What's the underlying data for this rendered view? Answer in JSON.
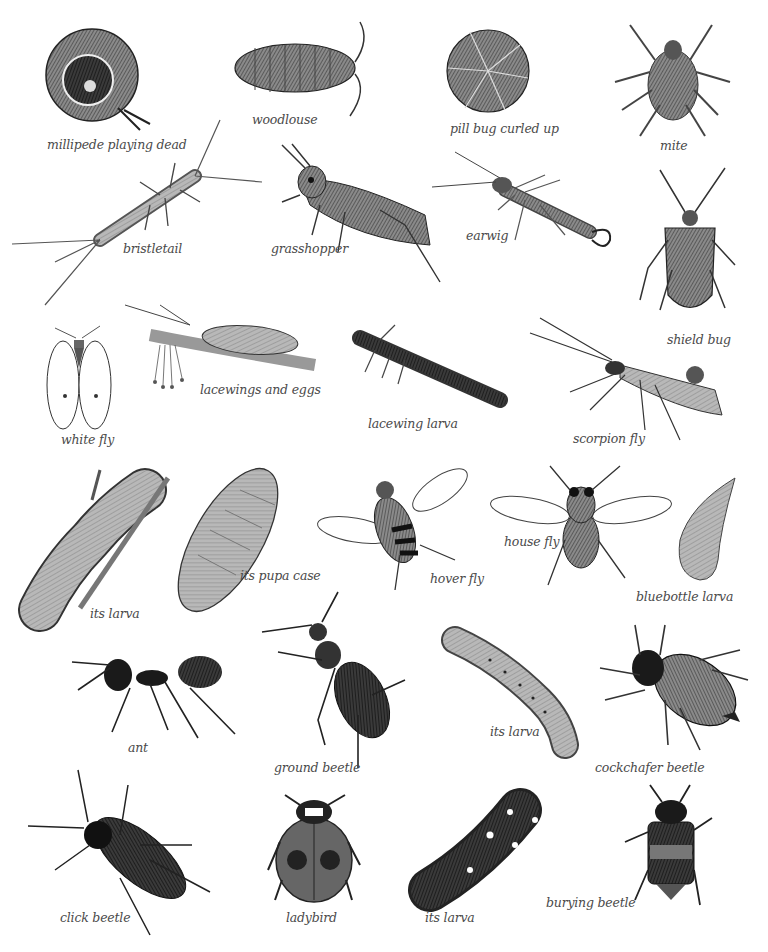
{
  "plate": {
    "background": "#ffffff",
    "ink_color": "#4a4a4a",
    "specimens": [
      {
        "id": "millipede",
        "label": "millipede playing dead",
        "x": 47,
        "y": 137
      },
      {
        "id": "woodlouse",
        "label": "woodlouse",
        "x": 252,
        "y": 112
      },
      {
        "id": "pill-bug",
        "label": "pill bug curled up",
        "x": 450,
        "y": 121
      },
      {
        "id": "mite",
        "label": "mite",
        "x": 660,
        "y": 138
      },
      {
        "id": "bristletail",
        "label": "bristletail",
        "x": 123,
        "y": 241
      },
      {
        "id": "grasshopper",
        "label": "grasshopper",
        "x": 271,
        "y": 241
      },
      {
        "id": "earwig",
        "label": "earwig",
        "x": 466,
        "y": 228
      },
      {
        "id": "shield-bug",
        "label": "shield bug",
        "x": 667,
        "y": 332
      },
      {
        "id": "lacewings",
        "label": "lacewings and eggs",
        "x": 200,
        "y": 382
      },
      {
        "id": "white-fly",
        "label": "white fly",
        "x": 61,
        "y": 432
      },
      {
        "id": "lacewing-larva",
        "label": "lacewing larva",
        "x": 368,
        "y": 416
      },
      {
        "id": "scorpion-fly",
        "label": "scorpion fly",
        "x": 573,
        "y": 431
      },
      {
        "id": "hover-fly-larva",
        "label": "its larva",
        "x": 90,
        "y": 606
      },
      {
        "id": "hover-fly-pupa",
        "label": "its pupa case",
        "x": 240,
        "y": 568
      },
      {
        "id": "hover-fly",
        "label": "hover fly",
        "x": 430,
        "y": 571
      },
      {
        "id": "house-fly",
        "label": "house fly",
        "x": 504,
        "y": 534
      },
      {
        "id": "bluebottle-larva",
        "label": "bluebottle larva",
        "x": 636,
        "y": 589
      },
      {
        "id": "ant",
        "label": "ant",
        "x": 128,
        "y": 740
      },
      {
        "id": "ground-beetle",
        "label": "ground beetle",
        "x": 274,
        "y": 760
      },
      {
        "id": "cockchafer-larva",
        "label": "its larva",
        "x": 490,
        "y": 724
      },
      {
        "id": "cockchafer",
        "label": "cockchafer beetle",
        "x": 595,
        "y": 760
      },
      {
        "id": "click-beetle",
        "label": "click beetle",
        "x": 60,
        "y": 910
      },
      {
        "id": "ladybird",
        "label": "ladybird",
        "x": 286,
        "y": 910
      },
      {
        "id": "ladybird-larva",
        "label": "its larva",
        "x": 425,
        "y": 910
      },
      {
        "id": "burying-beetle",
        "label": "burying beetle",
        "x": 546,
        "y": 895
      }
    ]
  }
}
